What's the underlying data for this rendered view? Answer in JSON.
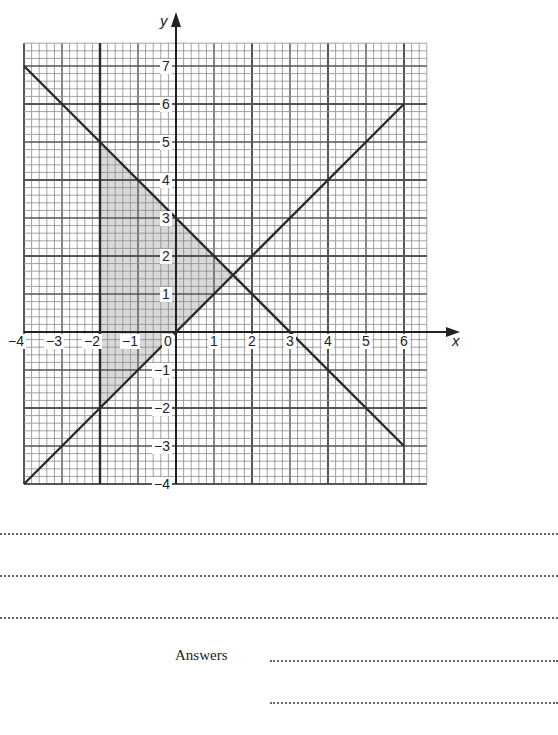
{
  "page": {
    "answers_label": "Answers",
    "working_lines": 3,
    "answer_lines": 2
  },
  "chart_data": {
    "type": "line",
    "title": "",
    "xlabel": "x",
    "ylabel": "y",
    "xlim": [
      -4,
      6.6
    ],
    "ylim": [
      -4,
      7.6
    ],
    "grid": true,
    "grid_minor_step": 0.2,
    "grid_major_step": 1,
    "grid_heavy_step": 2,
    "x_ticks": [
      "-4",
      "-3",
      "-2",
      "-1",
      "0",
      "1",
      "2",
      "3",
      "4",
      "5",
      "6"
    ],
    "y_ticks": [
      "-4",
      "-3",
      "-2",
      "-1",
      "1",
      "2",
      "3",
      "4",
      "5",
      "6",
      "7"
    ],
    "series": [
      {
        "name": "y = x",
        "points": [
          [
            -4,
            -4
          ],
          [
            6,
            6
          ]
        ]
      },
      {
        "name": "x + y = 3",
        "points": [
          [
            -4,
            7
          ],
          [
            6,
            -3
          ]
        ]
      },
      {
        "name": "x = -2",
        "points": [
          [
            -2,
            -4
          ],
          [
            -2,
            7.6
          ]
        ]
      }
    ],
    "shaded_region": {
      "description": "Region bounded by x = -2, y = x and x + y = 3",
      "vertices": [
        [
          -2,
          5
        ],
        [
          -2,
          -2
        ],
        [
          1.5,
          1.5
        ]
      ],
      "fill": "#d9d9d9"
    },
    "colors": {
      "grid_minor": "#8a8a8a",
      "grid_major": "#555555",
      "line": "#2b2b2b"
    }
  }
}
